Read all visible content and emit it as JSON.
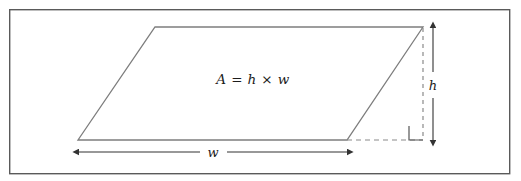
{
  "figure": {
    "name": "parallelogram-area-figure",
    "width": 521,
    "height": 181,
    "background_color": "#ffffff",
    "border": {
      "name": "figure-border",
      "color": "#5a5a5a",
      "x": 9,
      "y": 9,
      "width": 501,
      "height": 165,
      "stroke_width": 1.4
    },
    "colors": {
      "shape_stroke": "#7d7d7d",
      "dashed_stroke": "#8a8a8a",
      "arrow_stroke": "#333333",
      "text": "#1c1c1c",
      "right_angle_stroke": "#555555"
    },
    "shape": {
      "name": "parallelogram",
      "type": "parallelogram",
      "points": "155,27 423,27 347,140 78,140",
      "stroke_width": 1.3,
      "fill": "none"
    },
    "dashed_lines": [
      {
        "name": "dashed-base-extension",
        "x1": 347,
        "y1": 140,
        "x2": 423,
        "y2": 140
      },
      {
        "name": "dashed-height-line",
        "x1": 423,
        "y1": 28,
        "x2": 423,
        "y2": 140
      }
    ],
    "right_angle_marker": {
      "name": "right-angle-marker",
      "points": "409,126 409,140 423,140",
      "size": 14
    },
    "dimensions": [
      {
        "name": "width-dimension",
        "label": "w",
        "orientation": "horizontal",
        "axis_y": 152,
        "start": 79,
        "end": 347,
        "label_x": 212,
        "label_y": 157,
        "gap_start": 200,
        "gap_end": 227
      },
      {
        "name": "height-dimension",
        "label": "h",
        "orientation": "vertical",
        "axis_x": 433,
        "start": 28,
        "end": 140,
        "label_x": 433,
        "label_y": 90,
        "gap_start": 72,
        "gap_end": 98
      }
    ],
    "formula": {
      "name": "area-formula",
      "full_text": "A = h × w",
      "area_symbol": "A",
      "equals": "=",
      "height_symbol": "h",
      "times": "×",
      "width_symbol": "w",
      "x": 253,
      "y": 80
    }
  }
}
